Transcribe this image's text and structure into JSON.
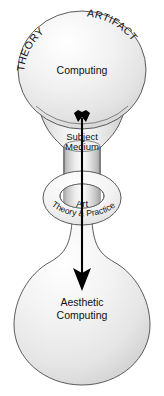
{
  "diagram": {
    "top_sphere": {
      "name": "computing-sphere",
      "center_label": "Computing",
      "arc_label_left": "THEORY",
      "arc_label_right": "ARTIFACT"
    },
    "neck": {
      "name": "subject-medium-neck",
      "label_line1": "Subject",
      "label_line2": "Medium"
    },
    "torus": {
      "name": "art-theory-practice-ring",
      "label_top": "Art",
      "label_arc": "Theory & Practice"
    },
    "bottom_bulb": {
      "name": "aesthetic-computing-bulb",
      "label_line1": "Aesthetic",
      "label_line2": "Computing"
    },
    "arrow": {
      "name": "downward-flow-arrow",
      "direction": "down",
      "from": "Computing",
      "to": "Aesthetic Computing"
    },
    "colors": {
      "background": "#ffffff",
      "outline": "#4a4a4a",
      "fill_light": "#fdfdfd",
      "fill_mid": "#e4e4e4",
      "fill_dark": "#c8c8c8",
      "text": "#111111",
      "arrow": "#000000"
    }
  }
}
